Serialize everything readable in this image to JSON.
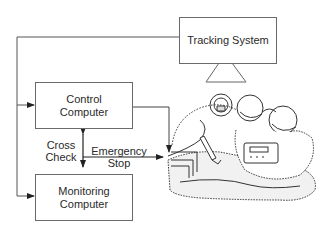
{
  "diagram": {
    "nodes": {
      "tracking_system": {
        "label": "Tracking System"
      },
      "control_computer": {
        "line1": "Control",
        "line2": "Computer"
      },
      "monitoring_computer": {
        "line1": "Monitoring",
        "line2": "Computer"
      }
    },
    "edge_labels": {
      "cross_check": {
        "line1": "Cross",
        "line2": "Check"
      },
      "emergency_stop": {
        "line1": "Emergency",
        "line2": "Stop"
      }
    },
    "illustration": {
      "subject": "surgical-robot-operating-scene"
    },
    "colors": {
      "line": "#3a3a3a",
      "box_border": "#6a6a6a",
      "text": "#2a2a2a",
      "background": "#ffffff"
    }
  }
}
